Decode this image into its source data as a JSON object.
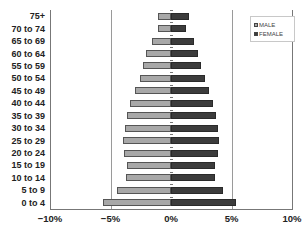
{
  "chart_data": {
    "type": "bar",
    "orientation": "horizontal",
    "subtype": "population-pyramid",
    "title": "",
    "xlabel": "",
    "ylabel": "",
    "categories": [
      "75+",
      "70 to 74",
      "65 to 69",
      "60 to 64",
      "55 to 59",
      "50 to 54",
      "45 to 49",
      "40 to 44",
      "35 to 39",
      "30 to 34",
      "25 to 29",
      "20 to 24",
      "15 to 19",
      "10 to 14",
      "5 to 9",
      "0 to 4"
    ],
    "series": [
      {
        "name": "MALE",
        "color": "#a8a8a8",
        "values": [
          -1.1,
          -1.1,
          -1.6,
          -2.1,
          -2.3,
          -2.6,
          -3.0,
          -3.4,
          -3.6,
          -3.8,
          -4.0,
          -3.9,
          -3.6,
          -3.7,
          -4.5,
          -5.6
        ]
      },
      {
        "name": "FEMALE",
        "color": "#3c3c3c",
        "values": [
          1.5,
          1.2,
          1.9,
          2.2,
          2.5,
          2.8,
          3.1,
          3.5,
          3.7,
          3.9,
          4.0,
          3.9,
          3.6,
          3.6,
          4.3,
          5.4
        ]
      }
    ],
    "xlim": [
      -10,
      10
    ],
    "x_ticks": [
      "-10%",
      "-5%",
      "0%",
      "5%",
      "10%"
    ],
    "x_tick_values": [
      -10,
      -5,
      0,
      5,
      10
    ],
    "grid": {
      "vertical_at": [
        -5,
        5
      ]
    },
    "legend": {
      "position": "top-right",
      "entries": [
        "MALE",
        "FEMALE"
      ]
    }
  }
}
